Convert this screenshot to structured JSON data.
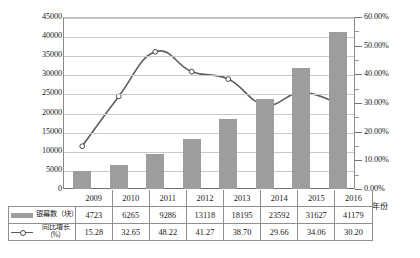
{
  "chart_data": {
    "type": "bar",
    "title": "",
    "subtitle": "",
    "xlabel": "年份",
    "ylabel": "",
    "y2label": "",
    "categories": [
      "2009",
      "2010",
      "2011",
      "2012",
      "2013",
      "2014",
      "2015",
      "2016"
    ],
    "series": [
      {
        "name": "银幕数（块）",
        "type": "bar",
        "axis": "left",
        "color": "#9d9d9d",
        "values": [
          4723,
          6265,
          9286,
          13118,
          18195,
          23592,
          31627,
          41179
        ]
      },
      {
        "name": "同比增长（%）",
        "type": "line",
        "axis": "right",
        "color": "#5e5e5e",
        "values": [
          15.28,
          32.65,
          48.22,
          41.27,
          38.7,
          29.66,
          34.06,
          30.2
        ]
      }
    ],
    "ylim": [
      0,
      45000
    ],
    "yticks": [
      0,
      5000,
      10000,
      15000,
      20000,
      25000,
      30000,
      35000,
      40000,
      45000
    ],
    "ytick_labels": [
      "0",
      "5000",
      "10000",
      "15000",
      "20000",
      "25000",
      "30000",
      "35000",
      "40000",
      "45000"
    ],
    "y2lim": [
      0,
      60
    ],
    "y2ticks": [
      0,
      10,
      20,
      30,
      40,
      50,
      60
    ],
    "y2tick_labels": [
      "0.00%",
      "10.00%",
      "20.00%",
      "30.00%",
      "40.00%",
      "50.00%",
      "60.00%"
    ],
    "y2_minor_step": 5,
    "grid": true,
    "legend_position": "table-below"
  },
  "table": {
    "header": [
      "2009",
      "2010",
      "2011",
      "2012",
      "2013",
      "2014",
      "2015",
      "2016"
    ],
    "rows": [
      {
        "legend_main": "银幕数（块）",
        "legend_sub": "",
        "marker": "bar-swatch",
        "values": [
          "4723",
          "6265",
          "9286",
          "13118",
          "18195",
          "23592",
          "31627",
          "41179"
        ]
      },
      {
        "legend_main": "同比增长",
        "legend_sub": "（%）",
        "marker": "line-swatch",
        "values": [
          "15.28",
          "32.65",
          "48.22",
          "41.27",
          "38.70",
          "29.66",
          "34.06",
          "30.20"
        ]
      }
    ]
  },
  "axis": {
    "x_axis_title": "年份"
  }
}
